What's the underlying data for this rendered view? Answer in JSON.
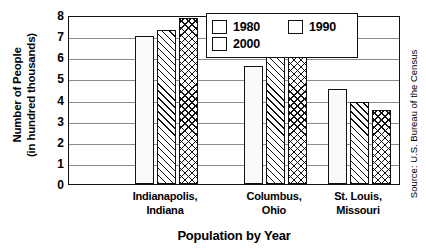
{
  "chart_data": {
    "type": "bar",
    "title": "",
    "xlabel": "Population by Year",
    "ylabel_line1": "Number of People",
    "ylabel_line2": "(in hundred thousands)",
    "categories": [
      "Indianapolis,\nIndiana",
      "Columbus,\nOhio",
      "St. Louis,\nMissouri"
    ],
    "category_lines": [
      [
        "Indianapolis,",
        "Indiana"
      ],
      [
        "Columbus,",
        "Ohio"
      ],
      [
        "St. Louis,",
        "Missouri"
      ]
    ],
    "series": [
      {
        "name": "1980",
        "values": [
          7.0,
          5.6,
          4.5
        ],
        "pattern": "dotted"
      },
      {
        "name": "1990",
        "values": [
          7.3,
          6.3,
          3.9
        ],
        "pattern": "diagonal-hatch"
      },
      {
        "name": "2000",
        "values": [
          7.85,
          7.2,
          3.5
        ],
        "pattern": "crosshatch"
      }
    ],
    "ylim": [
      0,
      8
    ],
    "yticks": [
      8,
      7,
      6,
      5,
      4,
      3,
      2,
      1,
      0
    ],
    "ytick_labels": [
      "8",
      "7",
      "6",
      "5",
      "4",
      "3",
      "2",
      "1",
      "0"
    ],
    "grid": true,
    "grid_axis": "y",
    "legend_position": "top-right-inside",
    "legend_entries": [
      "1980",
      "1990",
      "2000"
    ],
    "source_note": "Source: U.S. Bureau of the Census",
    "colors": {
      "axis": "#111111",
      "grid": "#8b8b8b",
      "background": "#ffffff",
      "text": "#000000"
    }
  }
}
